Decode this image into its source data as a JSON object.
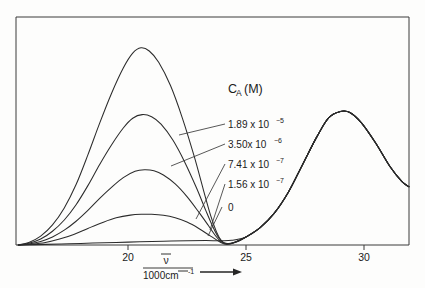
{
  "figure": {
    "background_color": "#fdfdfc",
    "curve_color": "#2b2b2b",
    "axis_color": "#3a3a3a"
  },
  "legend": {
    "title_main": "C",
    "title_sub": "A",
    "title_unit": "(M)",
    "entries": [
      {
        "mantissa": "1.89 x 10",
        "exponent": "−5",
        "label": "1.89 x 10⁻⁵"
      },
      {
        "mantissa": "3.50x 10",
        "exponent": "−6",
        "label": "3.50x 10⁻⁶"
      },
      {
        "mantissa": "7.41 x 10",
        "exponent": "−7",
        "label": "7.41 x 10⁻⁷"
      },
      {
        "mantissa": "1.56 x 10",
        "exponent": "−7",
        "label": "1.56 x 10⁻⁷"
      },
      {
        "mantissa": "0",
        "exponent": "",
        "label": "0"
      }
    ]
  },
  "axis": {
    "x_title_numerator": "ν",
    "x_title_denominator": "1000cm",
    "x_title_denominator_sup": "-1",
    "x_title_full": "ν̄ / 1000cm⁻¹",
    "x_ticks": [
      "20",
      "25",
      "30"
    ]
  },
  "chart_data": {
    "type": "line",
    "title": "",
    "subtitle": "",
    "xlabel": "ν̄ / 1000cm⁻¹",
    "ylabel": "",
    "xlim": [
      15.3,
      31.9
    ],
    "ylim": [
      0,
      1.0
    ],
    "grid": false,
    "legend_position": "inside-right",
    "legend_title": "C_A (M)",
    "x_ticks": [
      20,
      25,
      30
    ],
    "y_ticks": [],
    "annotations": [
      "Absorption spectra of an indicator at varying analyte concentration C_A",
      "Isosbestic-like convergence near 23.8 ×10³ cm⁻¹",
      "Common band near 29 ×10³ cm⁻¹ shared by all curves"
    ],
    "series": [
      {
        "name": "1.89 x 10⁻⁵",
        "peak_x": 20.55,
        "peak_y": 0.93,
        "points": [
          [
            15.35,
            0.0
          ],
          [
            15.8,
            0.012
          ],
          [
            16.3,
            0.042
          ],
          [
            16.8,
            0.095
          ],
          [
            17.3,
            0.175
          ],
          [
            17.8,
            0.285
          ],
          [
            18.3,
            0.425
          ],
          [
            18.8,
            0.575
          ],
          [
            19.3,
            0.715
          ],
          [
            19.8,
            0.835
          ],
          [
            20.2,
            0.905
          ],
          [
            20.55,
            0.93
          ],
          [
            20.9,
            0.915
          ],
          [
            21.3,
            0.862
          ],
          [
            21.8,
            0.752
          ],
          [
            22.3,
            0.6
          ],
          [
            22.8,
            0.42
          ],
          [
            23.2,
            0.258
          ],
          [
            23.5,
            0.14
          ],
          [
            23.75,
            0.062
          ],
          [
            23.95,
            0.022
          ],
          [
            24.15,
            0.008
          ],
          [
            24.5,
            0.012
          ],
          [
            25.0,
            0.038
          ],
          [
            25.6,
            0.082
          ],
          [
            26.2,
            0.15
          ],
          [
            26.8,
            0.25
          ],
          [
            27.4,
            0.38
          ],
          [
            28.0,
            0.51
          ],
          [
            28.5,
            0.6
          ],
          [
            29.0,
            0.63
          ],
          [
            29.4,
            0.625
          ],
          [
            29.9,
            0.575
          ],
          [
            30.5,
            0.48
          ],
          [
            31.1,
            0.37
          ],
          [
            31.6,
            0.3
          ],
          [
            31.9,
            0.275
          ]
        ]
      },
      {
        "name": "3.50x 10⁻⁶",
        "peak_x": 20.6,
        "peak_y": 0.615,
        "points": [
          [
            15.35,
            0.0
          ],
          [
            15.8,
            0.008
          ],
          [
            16.3,
            0.028
          ],
          [
            16.8,
            0.065
          ],
          [
            17.3,
            0.118
          ],
          [
            17.8,
            0.19
          ],
          [
            18.3,
            0.28
          ],
          [
            18.8,
            0.38
          ],
          [
            19.3,
            0.472
          ],
          [
            19.8,
            0.552
          ],
          [
            20.2,
            0.598
          ],
          [
            20.6,
            0.615
          ],
          [
            21.0,
            0.605
          ],
          [
            21.4,
            0.57
          ],
          [
            21.9,
            0.495
          ],
          [
            22.4,
            0.392
          ],
          [
            22.9,
            0.27
          ],
          [
            23.3,
            0.162
          ],
          [
            23.6,
            0.085
          ],
          [
            23.85,
            0.033
          ],
          [
            24.05,
            0.01
          ],
          [
            24.3,
            0.006
          ],
          [
            24.6,
            0.016
          ],
          [
            25.0,
            0.038
          ],
          [
            25.6,
            0.082
          ],
          [
            26.2,
            0.15
          ],
          [
            26.8,
            0.25
          ],
          [
            27.4,
            0.38
          ],
          [
            28.0,
            0.51
          ],
          [
            28.5,
            0.6
          ],
          [
            29.0,
            0.63
          ],
          [
            29.4,
            0.625
          ],
          [
            29.9,
            0.575
          ],
          [
            30.5,
            0.48
          ],
          [
            31.1,
            0.37
          ],
          [
            31.6,
            0.3
          ],
          [
            31.9,
            0.275
          ]
        ]
      },
      {
        "name": "7.41 x 10⁻⁷",
        "peak_x": 20.7,
        "peak_y": 0.355,
        "points": [
          [
            15.35,
            0.0
          ],
          [
            15.8,
            0.005
          ],
          [
            16.3,
            0.017
          ],
          [
            16.8,
            0.038
          ],
          [
            17.3,
            0.07
          ],
          [
            17.8,
            0.112
          ],
          [
            18.3,
            0.163
          ],
          [
            18.8,
            0.22
          ],
          [
            19.3,
            0.272
          ],
          [
            19.8,
            0.318
          ],
          [
            20.3,
            0.348
          ],
          [
            20.7,
            0.355
          ],
          [
            21.1,
            0.35
          ],
          [
            21.5,
            0.33
          ],
          [
            22.0,
            0.288
          ],
          [
            22.5,
            0.228
          ],
          [
            23.0,
            0.155
          ],
          [
            23.4,
            0.093
          ],
          [
            23.7,
            0.045
          ],
          [
            23.95,
            0.015
          ],
          [
            24.2,
            0.005
          ],
          [
            24.5,
            0.012
          ],
          [
            25.0,
            0.038
          ],
          [
            25.6,
            0.082
          ],
          [
            26.2,
            0.15
          ],
          [
            26.8,
            0.25
          ],
          [
            27.4,
            0.38
          ],
          [
            28.0,
            0.51
          ],
          [
            28.5,
            0.6
          ],
          [
            29.0,
            0.63
          ],
          [
            29.4,
            0.625
          ],
          [
            29.9,
            0.575
          ],
          [
            30.5,
            0.48
          ],
          [
            31.1,
            0.37
          ],
          [
            31.6,
            0.3
          ],
          [
            31.9,
            0.275
          ]
        ]
      },
      {
        "name": "1.56 x 10⁻⁷",
        "peak_x": 20.9,
        "peak_y": 0.145,
        "points": [
          [
            15.35,
            0.0
          ],
          [
            15.9,
            0.004
          ],
          [
            16.5,
            0.012
          ],
          [
            17.1,
            0.028
          ],
          [
            17.7,
            0.05
          ],
          [
            18.3,
            0.078
          ],
          [
            18.9,
            0.105
          ],
          [
            19.5,
            0.128
          ],
          [
            20.1,
            0.141
          ],
          [
            20.6,
            0.145
          ],
          [
            21.0,
            0.145
          ],
          [
            21.5,
            0.14
          ],
          [
            22.0,
            0.128
          ],
          [
            22.5,
            0.108
          ],
          [
            23.0,
            0.078
          ],
          [
            23.5,
            0.042
          ],
          [
            23.9,
            0.014
          ],
          [
            24.2,
            0.003
          ],
          [
            24.6,
            0.014
          ],
          [
            25.0,
            0.038
          ],
          [
            25.6,
            0.082
          ],
          [
            26.2,
            0.15
          ],
          [
            26.8,
            0.25
          ],
          [
            27.4,
            0.38
          ],
          [
            28.0,
            0.51
          ],
          [
            28.5,
            0.6
          ],
          [
            29.0,
            0.63
          ],
          [
            29.4,
            0.625
          ],
          [
            29.9,
            0.575
          ],
          [
            30.5,
            0.48
          ],
          [
            31.1,
            0.37
          ],
          [
            31.6,
            0.3
          ],
          [
            31.9,
            0.275
          ]
        ]
      },
      {
        "name": "0",
        "peak_x": 29.0,
        "peak_y": 0.63,
        "points": [
          [
            15.35,
            0.0
          ],
          [
            16.5,
            0.003
          ],
          [
            17.5,
            0.006
          ],
          [
            18.5,
            0.009
          ],
          [
            19.5,
            0.012
          ],
          [
            20.5,
            0.015
          ],
          [
            21.5,
            0.018
          ],
          [
            22.5,
            0.02
          ],
          [
            23.3,
            0.021
          ],
          [
            23.9,
            0.02
          ],
          [
            24.4,
            0.022
          ],
          [
            25.0,
            0.038
          ],
          [
            25.6,
            0.082
          ],
          [
            26.2,
            0.15
          ],
          [
            26.8,
            0.25
          ],
          [
            27.4,
            0.38
          ],
          [
            28.0,
            0.51
          ],
          [
            28.5,
            0.6
          ],
          [
            29.0,
            0.63
          ],
          [
            29.4,
            0.625
          ],
          [
            29.9,
            0.575
          ],
          [
            30.5,
            0.48
          ],
          [
            31.1,
            0.37
          ],
          [
            31.6,
            0.3
          ],
          [
            31.9,
            0.275
          ]
        ]
      }
    ]
  }
}
